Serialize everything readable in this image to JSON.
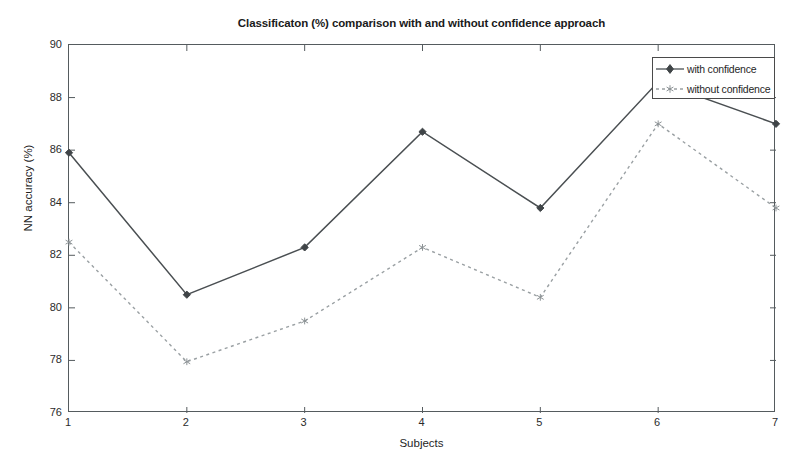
{
  "chart_data": {
    "type": "line",
    "title": "Classificaton (%) comparison with and without confidence approach",
    "xlabel": "Subjects",
    "ylabel": "NN accuracy (%)",
    "x": [
      1,
      2,
      3,
      4,
      5,
      6,
      7
    ],
    "categories": [
      "1",
      "2",
      "3",
      "4",
      "5",
      "6",
      "7"
    ],
    "xlim": [
      1,
      7
    ],
    "ylim": [
      76,
      90
    ],
    "ytick_labels": [
      "76",
      "78",
      "80",
      "82",
      "84",
      "86",
      "88",
      "90"
    ],
    "yticks": [
      76,
      78,
      80,
      82,
      84,
      86,
      88,
      90
    ],
    "xtick_labels": [
      "1",
      "2",
      "3",
      "4",
      "5",
      "6",
      "7"
    ],
    "xticks": [
      1,
      2,
      3,
      4,
      5,
      6,
      7
    ],
    "grid": false,
    "legend_position": "upper right",
    "series": [
      {
        "name": "with confidence",
        "values": [
          85.9,
          80.5,
          82.3,
          86.7,
          83.8,
          88.6,
          87.0
        ],
        "line_style": "solid",
        "marker": "diamond",
        "color": "#4a4f52"
      },
      {
        "name": "without confidence",
        "values": [
          82.5,
          77.95,
          79.5,
          82.3,
          80.4,
          87.0,
          83.8
        ],
        "line_style": "dotted",
        "marker": "star",
        "color": "#9aa0a3"
      }
    ]
  },
  "legend": {
    "entries": [
      {
        "label": "with confidence"
      },
      {
        "label": "without confidence"
      }
    ]
  }
}
